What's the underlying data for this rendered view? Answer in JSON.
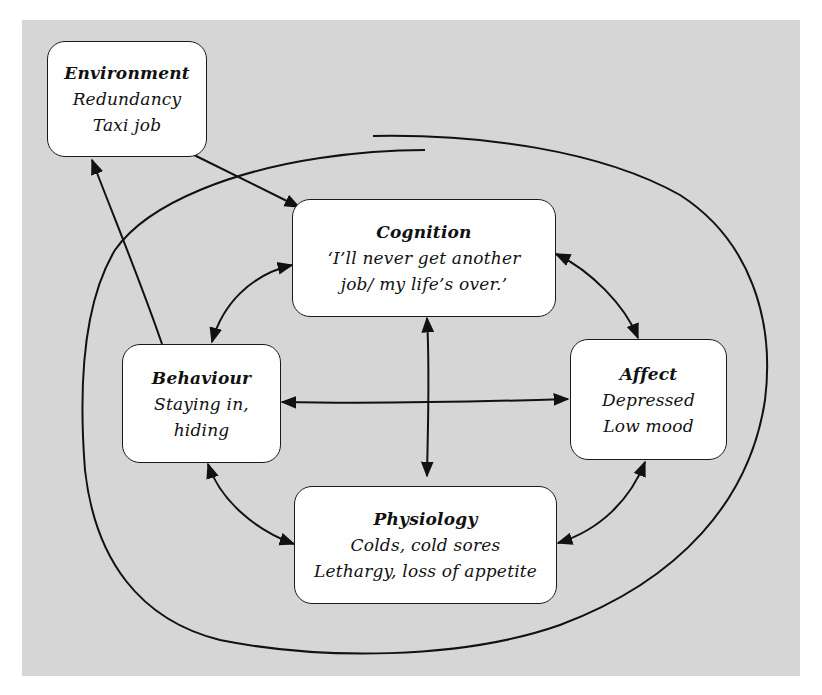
{
  "diagram": {
    "background_color": "#d6d6d6",
    "node_color": "#ffffff",
    "stroke_color": "#111111",
    "nodes": {
      "environment": {
        "title": "Environment",
        "lines": [
          "Redundancy",
          "Taxi job"
        ]
      },
      "cognition": {
        "title": "Cognition",
        "lines": [
          "‘I’ll never get another",
          "job/ my life’s over.’"
        ]
      },
      "behaviour": {
        "title": "Behaviour",
        "lines": [
          "Staying in,",
          "hiding"
        ]
      },
      "affect": {
        "title": "Affect",
        "lines": [
          "Depressed",
          "Low mood"
        ]
      },
      "physiology": {
        "title": "Physiology",
        "lines": [
          "Colds, cold sores",
          "Lethargy, loss of appetite"
        ]
      }
    },
    "edges": [
      {
        "from": "environment",
        "to": "cognition",
        "direction": "one-way"
      },
      {
        "from": "behaviour",
        "to": "environment",
        "direction": "one-way"
      },
      {
        "from": "cognition",
        "to": "behaviour",
        "direction": "two-way"
      },
      {
        "from": "cognition",
        "to": "affect",
        "direction": "two-way"
      },
      {
        "from": "cognition",
        "to": "physiology",
        "direction": "two-way"
      },
      {
        "from": "behaviour",
        "to": "affect",
        "direction": "two-way"
      },
      {
        "from": "behaviour",
        "to": "physiology",
        "direction": "two-way"
      },
      {
        "from": "affect",
        "to": "physiology",
        "direction": "two-way"
      }
    ],
    "enclosure": "spiral loop surrounding cognition, behaviour, affect and physiology"
  }
}
